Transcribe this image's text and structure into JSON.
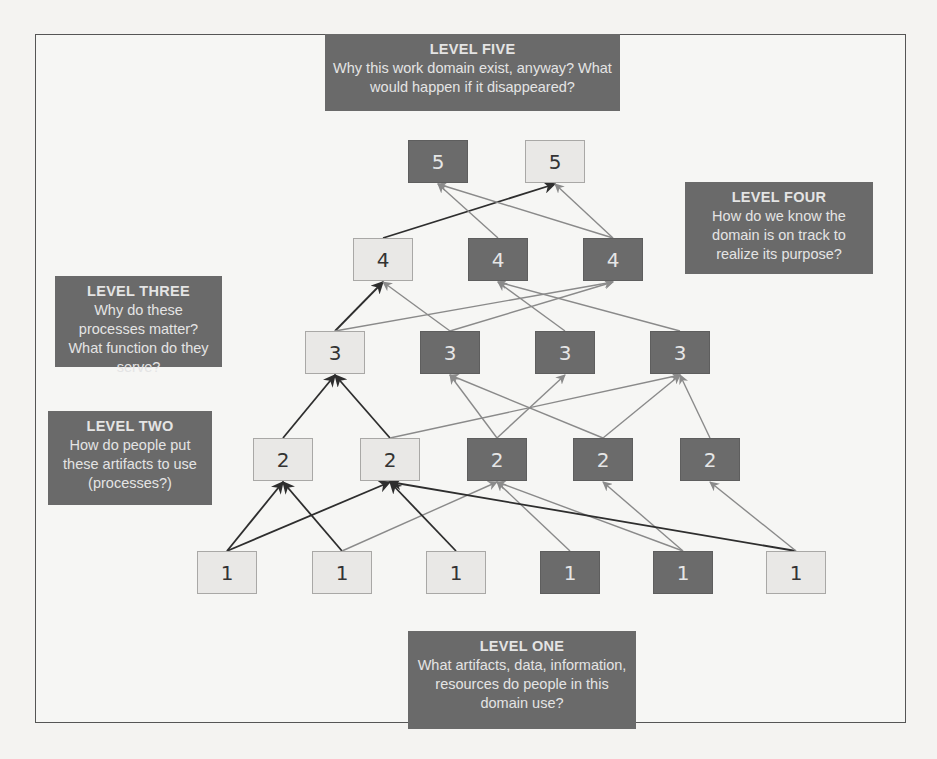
{
  "diagram": {
    "colors": {
      "callout_bg": "#6a6a6a",
      "callout_text": "#e4e4e4",
      "node_light_bg": "#e9e8e6",
      "node_dark_bg": "#6b6b6b",
      "edge_dark": "#2e2e2e",
      "edge_light": "#8a8a8a",
      "frame_border": "#555555"
    },
    "callouts": {
      "level_five": {
        "title": "LEVEL FIVE",
        "body": "Why this work domain exist, anyway? What would happen if it disappeared?"
      },
      "level_four": {
        "title": "LEVEL FOUR",
        "body": "How do we know the domain is on track to realize its purpose?"
      },
      "level_three": {
        "title": "LEVEL THREE",
        "body": "Why do these processes matter? What function do they serve?"
      },
      "level_two": {
        "title": "LEVEL TWO",
        "body": "How do people put these artifacts to use (processes?)"
      },
      "level_one": {
        "title": "LEVEL ONE",
        "body": "What artifacts, data, information, resources do people in this domain use?"
      }
    },
    "levels": {
      "l5": [
        {
          "label": "5",
          "style": "dark"
        },
        {
          "label": "5",
          "style": "light"
        }
      ],
      "l4": [
        {
          "label": "4",
          "style": "light"
        },
        {
          "label": "4",
          "style": "dark"
        },
        {
          "label": "4",
          "style": "dark"
        }
      ],
      "l3": [
        {
          "label": "3",
          "style": "light"
        },
        {
          "label": "3",
          "style": "dark"
        },
        {
          "label": "3",
          "style": "dark"
        },
        {
          "label": "3",
          "style": "dark"
        }
      ],
      "l2": [
        {
          "label": "2",
          "style": "light"
        },
        {
          "label": "2",
          "style": "light"
        },
        {
          "label": "2",
          "style": "dark"
        },
        {
          "label": "2",
          "style": "dark"
        },
        {
          "label": "2",
          "style": "dark"
        }
      ],
      "l1": [
        {
          "label": "1",
          "style": "light"
        },
        {
          "label": "1",
          "style": "light"
        },
        {
          "label": "1",
          "style": "light"
        },
        {
          "label": "1",
          "style": "dark"
        },
        {
          "label": "1",
          "style": "dark"
        },
        {
          "label": "1",
          "style": "light"
        }
      ]
    },
    "edges": [
      {
        "from": "l1.0",
        "to": "l2.0",
        "tone": "dark"
      },
      {
        "from": "l1.0",
        "to": "l2.1",
        "tone": "dark"
      },
      {
        "from": "l1.1",
        "to": "l2.0",
        "tone": "dark"
      },
      {
        "from": "l1.1",
        "to": "l2.2",
        "tone": "light"
      },
      {
        "from": "l1.2",
        "to": "l2.1",
        "tone": "dark"
      },
      {
        "from": "l1.3",
        "to": "l2.2",
        "tone": "light"
      },
      {
        "from": "l1.4",
        "to": "l2.2",
        "tone": "light"
      },
      {
        "from": "l1.4",
        "to": "l2.3",
        "tone": "light"
      },
      {
        "from": "l1.5",
        "to": "l2.1",
        "tone": "dark"
      },
      {
        "from": "l1.5",
        "to": "l2.4",
        "tone": "light"
      },
      {
        "from": "l2.0",
        "to": "l3.0",
        "tone": "dark"
      },
      {
        "from": "l2.1",
        "to": "l3.0",
        "tone": "dark"
      },
      {
        "from": "l2.1",
        "to": "l3.3",
        "tone": "light"
      },
      {
        "from": "l2.2",
        "to": "l3.1",
        "tone": "light"
      },
      {
        "from": "l2.2",
        "to": "l3.2",
        "tone": "light"
      },
      {
        "from": "l2.3",
        "to": "l3.1",
        "tone": "light"
      },
      {
        "from": "l2.3",
        "to": "l3.3",
        "tone": "light"
      },
      {
        "from": "l2.4",
        "to": "l3.3",
        "tone": "light"
      },
      {
        "from": "l3.0",
        "to": "l4.0",
        "tone": "dark"
      },
      {
        "from": "l3.0",
        "to": "l4.2",
        "tone": "light"
      },
      {
        "from": "l3.1",
        "to": "l4.0",
        "tone": "light"
      },
      {
        "from": "l3.1",
        "to": "l4.2",
        "tone": "light"
      },
      {
        "from": "l3.2",
        "to": "l4.1",
        "tone": "light"
      },
      {
        "from": "l3.3",
        "to": "l4.1",
        "tone": "light"
      },
      {
        "from": "l4.0",
        "to": "l5.1",
        "tone": "dark"
      },
      {
        "from": "l4.1",
        "to": "l5.0",
        "tone": "light"
      },
      {
        "from": "l4.2",
        "to": "l5.0",
        "tone": "light"
      },
      {
        "from": "l4.2",
        "to": "l5.1",
        "tone": "light"
      }
    ]
  }
}
